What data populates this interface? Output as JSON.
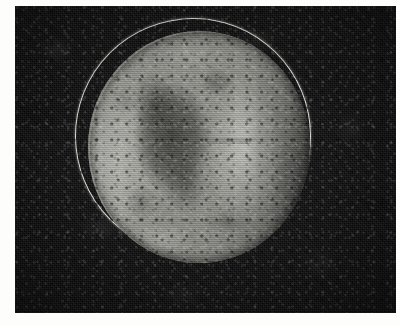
{
  "figure": {
    "kind": "astronomical-plate",
    "subject_label": "planetary disk",
    "caption": "",
    "title": "",
    "annotations": [],
    "text_labels": []
  },
  "plate": {
    "background_color": "#0d0d0d",
    "grain": "heavy",
    "margin_color": "#fdfdfb",
    "bounds": {
      "left": 15,
      "top": 6,
      "width": 381,
      "height": 307
    }
  },
  "disk": {
    "label": "",
    "center_x": 184,
    "center_y": 141,
    "radius_x": 111,
    "radius_y": 116,
    "body_color": "#8a8a83",
    "highlight_color": "#c9c9c2",
    "shadow_color": "#2a2a27"
  },
  "limb_arc": {
    "label": "",
    "color": "#ecece6",
    "stroke_width": 1.6,
    "center_x": 177,
    "center_y": 129,
    "radius": 117
  },
  "features": [
    {
      "name": "dark-albedo-patch",
      "label": ""
    },
    {
      "name": "bright-band",
      "label": ""
    },
    {
      "name": "bright-limb",
      "label": ""
    }
  ]
}
